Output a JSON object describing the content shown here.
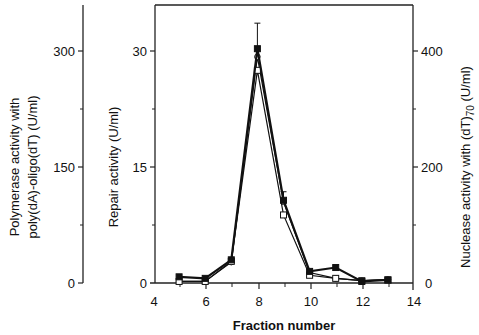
{
  "chart_data": {
    "type": "line",
    "title": "",
    "xlabel": "Fraction number",
    "x_ticks": [
      "4",
      "6",
      "8",
      "10",
      "12",
      "14"
    ],
    "xlim": [
      4,
      14
    ],
    "axes": {
      "left_outer": {
        "label_line1": "Polymerase activity with",
        "label_line2": "poly(dA)-oligo(dT)  (U/ml)",
        "ticks": [
          "0",
          "150",
          "300"
        ],
        "ylim": [
          0,
          360
        ]
      },
      "left_inner": {
        "label": "Repair activity  (U/ml)",
        "ticks": [
          "0",
          "15",
          "30"
        ],
        "ylim": [
          0,
          36
        ]
      },
      "right": {
        "label_main": "Nuclease activity with (dT)",
        "label_sub": "70",
        "label_unit": " (U/ml)",
        "ticks": [
          "0",
          "200",
          "400"
        ],
        "ylim": [
          0,
          480
        ]
      }
    },
    "x": [
      5,
      6,
      7,
      8,
      9,
      10,
      11,
      12,
      13
    ],
    "series": [
      {
        "name": "Repair activity",
        "marker": "filled-square",
        "axis": "left_inner",
        "values": [
          0.8,
          0.6,
          3.0,
          30.3,
          10.7,
          1.5,
          2.0,
          0.2,
          0.4
        ],
        "error_top": [
          null,
          null,
          null,
          33.6,
          11.8,
          null,
          null,
          null,
          null
        ]
      },
      {
        "name": "Polymerase activity",
        "marker": "open-square",
        "axis": "left_outer",
        "values": [
          2,
          2,
          28,
          275,
          88,
          10,
          6,
          3,
          4
        ]
      },
      {
        "name": "Nuclease activity",
        "marker": "open-circle",
        "axis": "right",
        "values": [
          3,
          3,
          36,
          390,
          140,
          18,
          8,
          4,
          6
        ]
      }
    ],
    "grid": false,
    "legend": null
  }
}
